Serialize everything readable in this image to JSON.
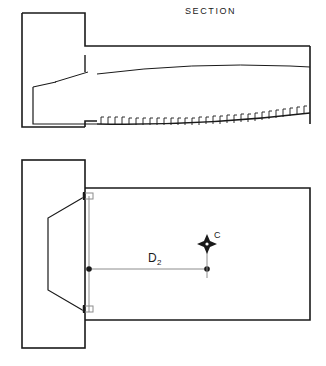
{
  "drawing": {
    "background_color": "#ffffff",
    "line_color": "#1a1a1a",
    "thin_line_color": "#8c8c8c",
    "section_view": {
      "title": "SECTION",
      "title_position": {
        "x": 185,
        "y": 14
      },
      "outer_block": {
        "x": 22,
        "y": 13,
        "width": 63,
        "height": 117
      },
      "body_rect": {
        "x": 85,
        "y": 46,
        "width": 225,
        "height": 78
      },
      "notes": "longitudinal section of a tapered body with serrated underside"
    },
    "plan_view": {
      "outer_block": {
        "x": 22,
        "y": 160,
        "width": 63,
        "height": 188
      },
      "body_rect": {
        "x": 85,
        "y": 188,
        "width": 225,
        "height": 132
      },
      "trapezoid_note": "internal tapered cavity outline",
      "dimension": {
        "label": "D",
        "subscript": "2",
        "label_position": {
          "x": 148,
          "y": 262
        },
        "line_start": {
          "x": 89,
          "y": 269
        },
        "line_end": {
          "x": 207,
          "y": 269
        }
      },
      "centroid_marker": {
        "label": "C",
        "label_position": {
          "x": 214,
          "y": 238
        },
        "marker_position": {
          "x": 207,
          "y": 241
        },
        "marker_style": "four-point-star"
      }
    }
  }
}
